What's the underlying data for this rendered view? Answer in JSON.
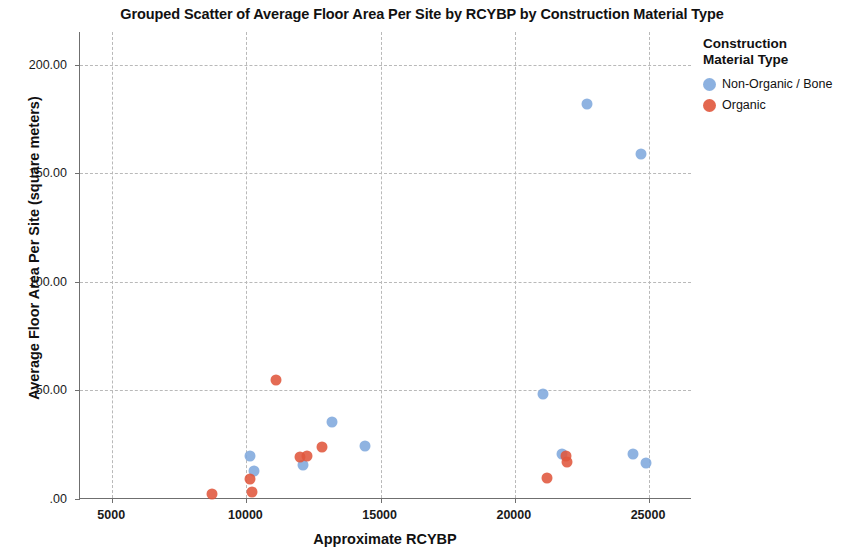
{
  "chart_data": {
    "type": "scatter",
    "title": "Grouped Scatter of Average Floor Area Per Site by RCYBP by Construction Material Type",
    "xlabel": "Approximate RCYBP",
    "ylabel": "Average Floor Area Per Site (square meters)",
    "xlim": [
      3800,
      26600
    ],
    "ylim": [
      0,
      215
    ],
    "grid": true,
    "xticks": [
      5000,
      10000,
      15000,
      20000,
      25000
    ],
    "xticklabels": [
      "5000",
      "10000",
      "15000",
      "20000",
      "25000"
    ],
    "yticks": [
      0,
      50,
      100,
      150,
      200
    ],
    "yticklabels": [
      ".00",
      "50.00",
      "100.00",
      "150.00",
      "200.00"
    ],
    "legend": {
      "title": "Construction\nMaterial Type",
      "title_line1": "Construction",
      "title_line2": "Material Type",
      "position": "right",
      "entries": [
        {
          "name": "Non-Organic / Bone",
          "color": "#7fa8dd"
        },
        {
          "name": "Organic",
          "color": "#e0563c"
        }
      ]
    },
    "series": [
      {
        "name": "Non-Organic / Bone",
        "color": "#7fa8dd",
        "points": [
          {
            "x": 10150,
            "y": 20.0
          },
          {
            "x": 10300,
            "y": 13.0
          },
          {
            "x": 12100,
            "y": 15.5
          },
          {
            "x": 13200,
            "y": 35.5
          },
          {
            "x": 14400,
            "y": 24.5
          },
          {
            "x": 21050,
            "y": 48.5
          },
          {
            "x": 21750,
            "y": 20.5
          },
          {
            "x": 22700,
            "y": 182.0
          },
          {
            "x": 24400,
            "y": 20.5
          },
          {
            "x": 24700,
            "y": 159.0
          },
          {
            "x": 24900,
            "y": 16.5
          }
        ]
      },
      {
        "name": "Organic",
        "color": "#e0563c",
        "points": [
          {
            "x": 8700,
            "y": 2.5
          },
          {
            "x": 10150,
            "y": 9.0
          },
          {
            "x": 10200,
            "y": 3.0
          },
          {
            "x": 11100,
            "y": 55.0
          },
          {
            "x": 12000,
            "y": 19.5
          },
          {
            "x": 12250,
            "y": 20.0
          },
          {
            "x": 12800,
            "y": 24.0
          },
          {
            "x": 21200,
            "y": 9.5
          },
          {
            "x": 21900,
            "y": 20.0
          },
          {
            "x": 21950,
            "y": 17.0
          }
        ]
      }
    ]
  }
}
